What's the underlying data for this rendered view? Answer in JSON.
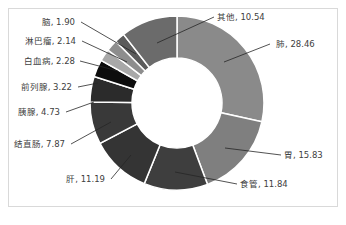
{
  "chart_data": {
    "type": "pie",
    "subtype": "donut",
    "title": "",
    "unit": "%",
    "start_angle_deg": 0,
    "direction": "clockwise",
    "categories": [
      "肺",
      "胃",
      "食管",
      "肝",
      "结直肠",
      "胰腺",
      "前列腺",
      "白血病",
      "淋巴瘤",
      "脑",
      "其他"
    ],
    "values": [
      28.46,
      15.83,
      11.84,
      11.19,
      7.87,
      4.73,
      3.22,
      2.28,
      2.14,
      1.9,
      10.54
    ],
    "colors": [
      "#8a8a8a",
      "#7f7f7f",
      "#3e3e3e",
      "#343434",
      "#393939",
      "#2b2b2b",
      "#0d0d0d",
      "#a8a8a8",
      "#8d8d8d",
      "#5b5b5b",
      "#6b6b6b"
    ],
    "labels": [
      {
        "text": "肺, 28.46",
        "x": 276,
        "y": 47,
        "anchor": "start",
        "lx1": 270,
        "ly1": 44,
        "lx2": 224,
        "ly2": 62
      },
      {
        "text": "胃, 15.83",
        "x": 284,
        "y": 158,
        "anchor": "start",
        "lx1": 281,
        "ly1": 155,
        "lx2": 225,
        "ly2": 148
      },
      {
        "text": "食管, 11.84",
        "x": 240,
        "y": 187,
        "anchor": "start",
        "lx1": 237,
        "ly1": 184,
        "lx2": 175,
        "ly2": 172
      },
      {
        "text": "肝, 11.19",
        "x": 105,
        "y": 182,
        "anchor": "end",
        "lx1": 111,
        "ly1": 179,
        "lx2": 131,
        "ly2": 155
      },
      {
        "text": "结直肠, 7.87",
        "x": 65,
        "y": 147,
        "anchor": "end",
        "lx1": 71,
        "ly1": 144,
        "lx2": 111,
        "ly2": 122
      },
      {
        "text": "胰腺, 4.73",
        "x": 60,
        "y": 115,
        "anchor": "end",
        "lx1": 66,
        "ly1": 112,
        "lx2": 94,
        "ly2": 102
      },
      {
        "text": "前列腺, 3.22",
        "x": 72,
        "y": 90,
        "anchor": "end",
        "lx1": 78,
        "ly1": 87,
        "lx2": 98,
        "ly2": 83
      },
      {
        "text": "白血病, 2.28",
        "x": 75,
        "y": 64,
        "anchor": "end",
        "lx1": 80,
        "ly1": 61,
        "lx2": 118,
        "ly2": 71
      },
      {
        "text": "淋巴瘤, 2.14",
        "x": 76,
        "y": 44,
        "anchor": "end",
        "lx1": 82,
        "ly1": 41,
        "lx2": 127,
        "ly2": 62
      },
      {
        "text": "脑, 1.90",
        "x": 75,
        "y": 25,
        "anchor": "end",
        "lx1": 81,
        "ly1": 22,
        "lx2": 136,
        "ly2": 54
      },
      {
        "text": "其他, 10.54",
        "x": 217,
        "y": 20,
        "anchor": "start",
        "lx1": 214,
        "ly1": 17,
        "lx2": 157,
        "ly2": 43
      }
    ],
    "legend": "none",
    "grid": false
  },
  "geometry": {
    "cx": 177,
    "cy": 103,
    "outer_r": 87,
    "inner_r": 45
  }
}
